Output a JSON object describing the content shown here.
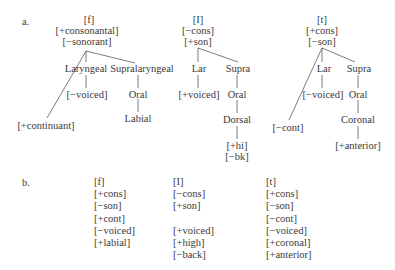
{
  "part_a": {
    "label": "a.",
    "trees": [
      {
        "segment": "[f]",
        "root_features": [
          "[+consonantal]",
          "[−sonorant]"
        ],
        "nodes": {
          "laryngeal": "Laryngeal",
          "supralaryngeal": "Supralaryngeal",
          "voicing": "[−voiced]",
          "oral": "Oral",
          "place": "Labial",
          "continuant": "[+continuant]"
        }
      },
      {
        "segment": "[I]",
        "root_features": [
          "[−cons]",
          "[+son]"
        ],
        "nodes": {
          "laryngeal": "Lar",
          "supralaryngeal": "Supra",
          "voicing": "[+voiced]",
          "oral": "Oral",
          "place": "Dorsal",
          "place_features": [
            "[+hi]",
            "[−bk]"
          ]
        }
      },
      {
        "segment": "[t]",
        "root_features": [
          "[+cons]",
          "[−son]"
        ],
        "nodes": {
          "laryngeal": "Lar",
          "supralaryngeal": "Supra",
          "voicing": "[−voiced]",
          "oral": "Oral",
          "place": "Coronal",
          "place_features": [
            "[+anterior]"
          ],
          "continuant": "[−cont]"
        }
      }
    ]
  },
  "part_b": {
    "label": "b.",
    "columns": [
      {
        "rows": [
          "[f]",
          "[+cons]",
          "[−son]",
          "[+cont]",
          "[−voiced]",
          "[+labial]",
          ""
        ]
      },
      {
        "rows": [
          "[I]",
          "[−cons]",
          "[+son]",
          "",
          "[+voiced]",
          "[+high]",
          "[−back]"
        ]
      },
      {
        "rows": [
          "[t]",
          "[+cons]",
          "[−son]",
          "[−cont]",
          "[−voiced]",
          "[+coronal]",
          "[+anterior]"
        ]
      }
    ]
  }
}
